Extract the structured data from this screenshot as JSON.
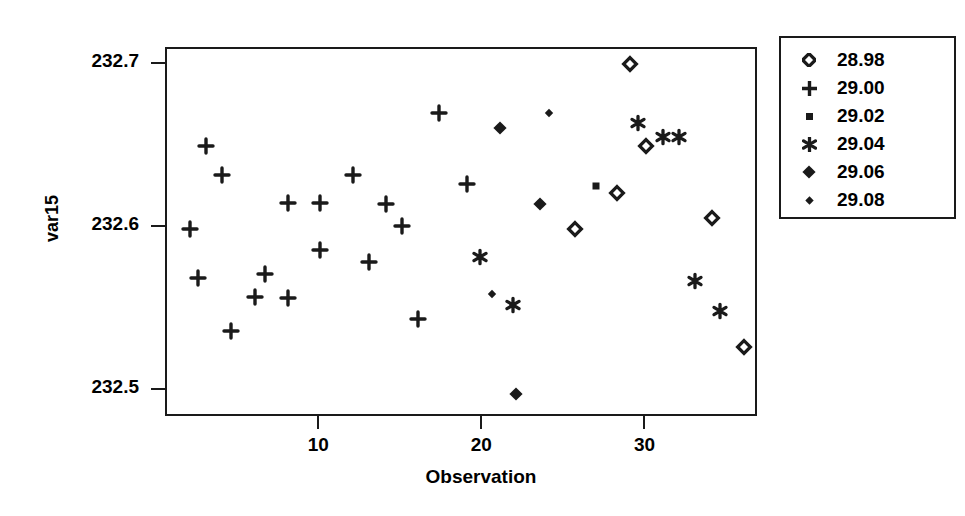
{
  "chart_data": {
    "type": "scatter",
    "title": "",
    "xlabel": "Observation",
    "ylabel": "var15",
    "xlim": [
      0.6,
      36.9
    ],
    "ylim": [
      232.4835,
      232.7095
    ],
    "xticks": [
      10,
      20,
      30
    ],
    "xtick_labels": [
      "10",
      "20",
      "30"
    ],
    "yticks": [
      232.5,
      232.6,
      232.7
    ],
    "ytick_labels": [
      "232.5",
      "232.6",
      "232.7"
    ],
    "grid": false,
    "legend_position": "right-outside",
    "legend_title": "",
    "series": [
      {
        "name": "28.98",
        "marker": "open-diamond",
        "points": [
          {
            "x": 29.0,
            "y": 232.7005
          },
          {
            "x": 30.0,
            "y": 232.6503
          },
          {
            "x": 25.6,
            "y": 232.599
          },
          {
            "x": 28.2,
            "y": 232.6214
          },
          {
            "x": 34.0,
            "y": 232.6061
          },
          {
            "x": 36.0,
            "y": 232.5272
          }
        ]
      },
      {
        "name": "29.00",
        "marker": "plus",
        "points": [
          {
            "x": 2.0,
            "y": 232.599
          },
          {
            "x": 3.0,
            "y": 232.6503
          },
          {
            "x": 2.5,
            "y": 232.569
          },
          {
            "x": 4.5,
            "y": 232.5367
          },
          {
            "x": 4.0,
            "y": 232.6326
          },
          {
            "x": 6.0,
            "y": 232.5578
          },
          {
            "x": 6.6,
            "y": 232.5714
          },
          {
            "x": 8.0,
            "y": 232.6149
          },
          {
            "x": 8.0,
            "y": 232.5572
          },
          {
            "x": 10.0,
            "y": 232.6149
          },
          {
            "x": 10.0,
            "y": 232.5861
          },
          {
            "x": 12.0,
            "y": 232.6326
          },
          {
            "x": 13.0,
            "y": 232.579
          },
          {
            "x": 14.0,
            "y": 232.6143
          },
          {
            "x": 15.0,
            "y": 232.6008
          },
          {
            "x": 16.0,
            "y": 232.5443
          },
          {
            "x": 17.3,
            "y": 232.6703
          },
          {
            "x": 19.0,
            "y": 232.6267
          }
        ]
      },
      {
        "name": "29.02",
        "marker": "small-square",
        "points": [
          {
            "x": 26.9,
            "y": 232.6255
          }
        ]
      },
      {
        "name": "29.04",
        "marker": "asterisk",
        "points": [
          {
            "x": 19.8,
            "y": 232.582
          },
          {
            "x": 21.8,
            "y": 232.5525
          },
          {
            "x": 29.5,
            "y": 232.6644
          },
          {
            "x": 31.0,
            "y": 232.6556
          },
          {
            "x": 32.0,
            "y": 232.6556
          },
          {
            "x": 33.0,
            "y": 232.5673
          },
          {
            "x": 34.5,
            "y": 232.549
          }
        ]
      },
      {
        "name": "29.06",
        "marker": "filled-diamond",
        "points": [
          {
            "x": 21.0,
            "y": 232.6614
          },
          {
            "x": 23.5,
            "y": 232.6143
          },
          {
            "x": 22.0,
            "y": 232.4984
          }
        ]
      },
      {
        "name": "29.08",
        "marker": "small-diamond",
        "points": [
          {
            "x": 24.0,
            "y": 232.6703
          },
          {
            "x": 20.5,
            "y": 232.5596
          }
        ]
      }
    ]
  },
  "legend": {
    "entries": [
      {
        "label": "28.98",
        "marker": "open-diamond"
      },
      {
        "label": "29.00",
        "marker": "plus"
      },
      {
        "label": "29.02",
        "marker": "small-square"
      },
      {
        "label": "29.04",
        "marker": "asterisk"
      },
      {
        "label": "29.06",
        "marker": "filled-diamond"
      },
      {
        "label": "29.08",
        "marker": "small-diamond"
      }
    ]
  },
  "colors": {
    "ink": "#1a1a1a",
    "background": "#ffffff"
  }
}
